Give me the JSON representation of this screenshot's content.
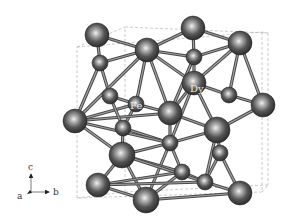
{
  "figure": {
    "title": "",
    "type": "crystal-structure",
    "background": "#ffffff",
    "atom_color_dark": "#3a3a3a",
    "atom_color_light": "#d8d8d8",
    "bond_color": "#6e6e6e",
    "cell_color": "#b5b5b5"
  },
  "labels": {
    "fe": "Fe",
    "dy": "Dy"
  },
  "axes": {
    "c": "c",
    "a": "a",
    "b": "b"
  },
  "unit_cell": {
    "front": [
      [
        77,
        47
      ],
      [
        262,
        32
      ],
      [
        262,
        192
      ],
      [
        77,
        198
      ]
    ],
    "back": [
      [
        125,
        27
      ],
      [
        268,
        33
      ],
      [
        268,
        185
      ],
      [
        125,
        192
      ]
    ]
  },
  "atoms": [
    {
      "id": "a1",
      "x": 97,
      "y": 35,
      "r": 12
    },
    {
      "id": "a2",
      "x": 193,
      "y": 28,
      "r": 12
    },
    {
      "id": "a3",
      "x": 147,
      "y": 50,
      "r": 12
    },
    {
      "id": "a4",
      "x": 240,
      "y": 43,
      "r": 12
    },
    {
      "id": "a5",
      "x": 100,
      "y": 63,
      "r": 8
    },
    {
      "id": "a6",
      "x": 194,
      "y": 57,
      "r": 8
    },
    {
      "id": "a7",
      "x": 194,
      "y": 83,
      "r": 12
    },
    {
      "id": "a8",
      "x": 110,
      "y": 96,
      "r": 8
    },
    {
      "id": "a9",
      "x": 136,
      "y": 104,
      "r": 8
    },
    {
      "id": "a10",
      "x": 229,
      "y": 95,
      "r": 8
    },
    {
      "id": "a11",
      "x": 263,
      "y": 105,
      "r": 12
    },
    {
      "id": "a12",
      "x": 75,
      "y": 121,
      "r": 12
    },
    {
      "id": "a13",
      "x": 170,
      "y": 113,
      "r": 12
    },
    {
      "id": "a14",
      "x": 123,
      "y": 128,
      "r": 8
    },
    {
      "id": "a15",
      "x": 217,
      "y": 130,
      "r": 13
    },
    {
      "id": "a16",
      "x": 170,
      "y": 143,
      "r": 8
    },
    {
      "id": "a17",
      "x": 122,
      "y": 155,
      "r": 13
    },
    {
      "id": "a18",
      "x": 220,
      "y": 153,
      "r": 8
    },
    {
      "id": "a19",
      "x": 182,
      "y": 172,
      "r": 8
    },
    {
      "id": "a20",
      "x": 205,
      "y": 182,
      "r": 8
    },
    {
      "id": "a21",
      "x": 98,
      "y": 185,
      "r": 12
    },
    {
      "id": "a22",
      "x": 146,
      "y": 200,
      "r": 13
    },
    {
      "id": "a23",
      "x": 240,
      "y": 193,
      "r": 12
    }
  ],
  "bonds": [
    [
      "a1",
      "a5"
    ],
    [
      "a1",
      "a3"
    ],
    [
      "a2",
      "a6"
    ],
    [
      "a2",
      "a4"
    ],
    [
      "a3",
      "a6"
    ],
    [
      "a3",
      "a5"
    ],
    [
      "a4",
      "a6"
    ],
    [
      "a3",
      "a7"
    ],
    [
      "a3",
      "a9"
    ],
    [
      "a3",
      "a13"
    ],
    [
      "a6",
      "a7"
    ],
    [
      "a4",
      "a7"
    ],
    [
      "a4",
      "a10"
    ],
    [
      "a4",
      "a11"
    ],
    [
      "a5",
      "a12"
    ],
    [
      "a5",
      "a8"
    ],
    [
      "a7",
      "a10"
    ],
    [
      "a7",
      "a13"
    ],
    [
      "a7",
      "a15"
    ],
    [
      "a10",
      "a11"
    ],
    [
      "a8",
      "a9"
    ],
    [
      "a9",
      "a12"
    ],
    [
      "a9",
      "a13"
    ],
    [
      "a9",
      "a14"
    ],
    [
      "a12",
      "a17"
    ],
    [
      "a12",
      "a13"
    ],
    [
      "a13",
      "a16"
    ],
    [
      "a13",
      "a15"
    ],
    [
      "a14",
      "a17"
    ],
    [
      "a15",
      "a16"
    ],
    [
      "a15",
      "a18"
    ],
    [
      "a11",
      "a15"
    ],
    [
      "a16",
      "a17"
    ],
    [
      "a16",
      "a19"
    ],
    [
      "a16",
      "a22"
    ],
    [
      "a17",
      "a21"
    ],
    [
      "a17",
      "a22"
    ],
    [
      "a18",
      "a20"
    ],
    [
      "a18",
      "a23"
    ],
    [
      "a19",
      "a20"
    ],
    [
      "a20",
      "a23"
    ],
    [
      "a21",
      "a22"
    ],
    [
      "a22",
      "a19"
    ],
    [
      "a21",
      "a19"
    ],
    [
      "a17",
      "a19"
    ],
    [
      "a8",
      "a14"
    ],
    [
      "a14",
      "a16"
    ],
    [
      "a2",
      "a3"
    ],
    [
      "a6",
      "a13"
    ],
    [
      "a12",
      "a16"
    ],
    [
      "a17",
      "a20"
    ],
    [
      "a21",
      "a20"
    ],
    [
      "a22",
      "a23"
    ],
    [
      "a3",
      "a12"
    ],
    [
      "a7",
      "a16"
    ],
    [
      "a15",
      "a20"
    ]
  ],
  "label_positions": {
    "fe": {
      "x": 130,
      "y": 109
    },
    "dy": {
      "x": 190,
      "y": 92
    }
  },
  "axis_indicator": {
    "origin_x": 31,
    "origin_y": 192,
    "length": 18
  }
}
